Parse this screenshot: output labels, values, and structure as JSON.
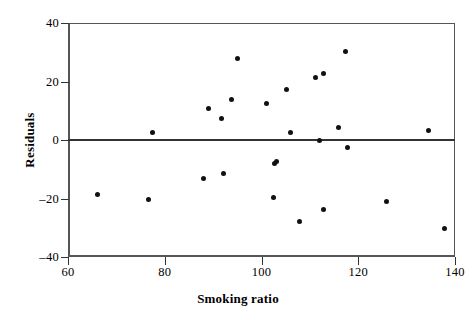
{
  "chart_data": {
    "type": "scatter",
    "title": "",
    "xlabel": "Smoking ratio",
    "ylabel": "Residuals",
    "xlim": [
      60,
      140
    ],
    "ylim": [
      -40,
      40
    ],
    "xticks": [
      60,
      80,
      100,
      120,
      140
    ],
    "yticks": [
      40,
      20,
      0,
      -20,
      -40
    ],
    "xtick_labels": [
      "60",
      "80",
      "100",
      "120",
      "140"
    ],
    "ytick_labels": [
      "40",
      "20",
      "0",
      "–20",
      "–40"
    ],
    "grid": false,
    "legend": null,
    "reference_lines": [
      {
        "axis": "y",
        "value": 0,
        "style": "solid"
      }
    ],
    "marker": {
      "shape": "circle",
      "color": "#111111",
      "size": 5
    },
    "points": [
      {
        "x": 66.0,
        "y": -18.5
      },
      {
        "x": 76.6,
        "y": -20.5
      },
      {
        "x": 77.4,
        "y": 2.4
      },
      {
        "x": 88.0,
        "y": -13.0
      },
      {
        "x": 89.0,
        "y": 10.9
      },
      {
        "x": 91.7,
        "y": 7.2
      },
      {
        "x": 92.1,
        "y": -11.3
      },
      {
        "x": 93.9,
        "y": 13.7
      },
      {
        "x": 95.0,
        "y": 27.7
      },
      {
        "x": 101.0,
        "y": 12.6
      },
      {
        "x": 102.4,
        "y": -19.8
      },
      {
        "x": 102.6,
        "y": -7.9
      },
      {
        "x": 103.0,
        "y": -7.2
      },
      {
        "x": 105.1,
        "y": 17.4
      },
      {
        "x": 105.9,
        "y": 2.7
      },
      {
        "x": 107.8,
        "y": -28.0
      },
      {
        "x": 111.1,
        "y": 21.2
      },
      {
        "x": 111.9,
        "y": -0.3
      },
      {
        "x": 112.8,
        "y": -23.9
      },
      {
        "x": 112.9,
        "y": 22.9
      },
      {
        "x": 115.9,
        "y": 4.2
      },
      {
        "x": 117.4,
        "y": 30.1
      },
      {
        "x": 117.7,
        "y": -2.6
      },
      {
        "x": 125.8,
        "y": -20.9
      },
      {
        "x": 134.5,
        "y": 3.1
      },
      {
        "x": 137.8,
        "y": -30.4
      }
    ]
  },
  "axes": {
    "x_title": "Smoking ratio",
    "y_title": "Residuals"
  },
  "colors": {
    "marker": "#111111",
    "frame": "#555555",
    "zero_line": "#333333",
    "background": "#ffffff"
  }
}
